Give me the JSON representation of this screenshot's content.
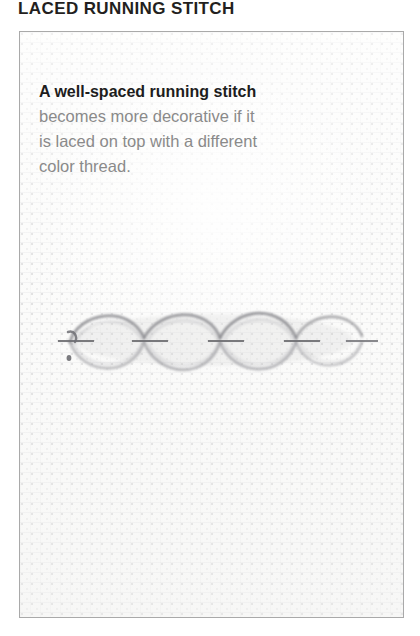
{
  "page": {
    "title": "LACED RUNNING STITCH",
    "background_color": "#ffffff"
  },
  "panel": {
    "border_color": "#a9a9a9",
    "fabric_color": "#fcfcfb",
    "fabric_name": "aida-cloth"
  },
  "caption": {
    "lead_line": "A well-spaced running stitch",
    "lines": [
      "becomes more decorative if it",
      "is laced on top with a different",
      "color thread."
    ],
    "lead_color": "#1d1d1d",
    "body_color": "#8a8a8a"
  },
  "illustration": {
    "name": "laced-running-stitch-sample",
    "alt": "Photograph of a laced running stitch worked on aida cloth",
    "thread_color": "#8d8d92",
    "lace_color": "#9a9a9f",
    "loop_count": 4,
    "running_stitch_count": 5
  }
}
